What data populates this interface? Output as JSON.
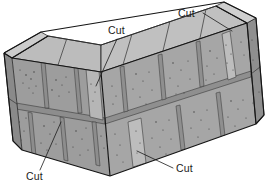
{
  "figure": {
    "background_color": "#ffffff",
    "view": "isometric",
    "width": 270,
    "height": 196
  },
  "palette": {
    "top_face": "#b9b9b9",
    "left_wall_face": "#9d9d9d",
    "right_wall_face": "#a6a6a6",
    "end_face_dark": "#8a8a8a",
    "cut_block_light": "#bdbdbd",
    "mortar_joint": "#8f8f8f",
    "outline": "#141414",
    "joint_line": "#3a3a3a",
    "text": "#1b1b1b",
    "leader_line": "#1b1b1b",
    "speckle": "#3c3c3c"
  },
  "labels": [
    {
      "id": "cut-top-right",
      "text": "Cut",
      "text_x": 178,
      "text_y": 17,
      "leader": [
        [
          203,
          13
        ],
        [
          232,
          31
        ]
      ],
      "points_to": "narrow cut block at right end of upper course, right wall"
    },
    {
      "id": "cut-upper-middle",
      "text": "Cut",
      "text_x": 108,
      "text_y": 34,
      "leader": [
        [
          117,
          39
        ],
        [
          96,
          86
        ]
      ],
      "points_to": "narrow cut block at corner of upper course"
    },
    {
      "id": "cut-bottom-left",
      "text": "Cut",
      "text_x": 26,
      "text_y": 180,
      "leader": [
        [
          40,
          170
        ],
        [
          61,
          122
        ]
      ],
      "points_to": "cut block head joint in lower course, left wall"
    },
    {
      "id": "cut-bottom-right",
      "text": "Cut",
      "text_x": 176,
      "text_y": 172,
      "leader": [
        [
          173,
          168
        ],
        [
          137,
          151
        ]
      ],
      "points_to": "narrow cut block in lower course, right wall"
    }
  ],
  "structure": {
    "corner_apex_top_x": 101,
    "corner_apex_top_y": 72,
    "corner_apex_bottom_x": 110,
    "corner_apex_bottom_y": 176,
    "courses": 2,
    "bond_pattern": "running bond",
    "left_wall_blocks_upper": 3,
    "left_wall_blocks_lower": 3,
    "right_wall_blocks_upper": 4,
    "right_wall_blocks_lower": 3,
    "cut_block_count": 4
  }
}
